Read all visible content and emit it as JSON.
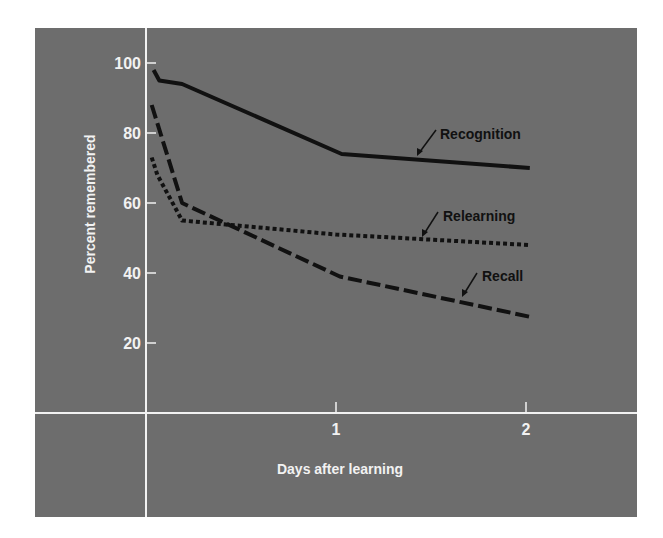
{
  "chart_data": {
    "type": "line",
    "title": "",
    "xlabel": "Days after learning",
    "ylabel": "Percent remembered",
    "xlim": [
      0,
      2.3
    ],
    "ylim": [
      0,
      100
    ],
    "x_ticks": [
      1,
      2
    ],
    "x_tick_labels": [
      "1",
      "2"
    ],
    "y_ticks": [
      20,
      40,
      60,
      80,
      100
    ],
    "y_tick_labels": [
      "20",
      "40",
      "60",
      "80",
      "100"
    ],
    "grid": false,
    "legend": "inline labels with arrows",
    "series": [
      {
        "name": "Recognition",
        "style": "solid",
        "x": [
          0.04,
          0.07,
          0.19,
          1.03,
          2.02
        ],
        "values": [
          98,
          95,
          94,
          74,
          70
        ]
      },
      {
        "name": "Relearning",
        "style": "dotted",
        "x": [
          0.03,
          0.06,
          0.19,
          1.0,
          2.02
        ],
        "values": [
          73,
          68,
          55,
          51,
          48
        ]
      },
      {
        "name": "Recall",
        "style": "dashed",
        "x": [
          0.03,
          0.19,
          1.02,
          2.02
        ],
        "values": [
          88,
          60,
          39,
          27.5
        ]
      }
    ]
  },
  "colors": {
    "background": "#6d6d6d",
    "axis": "#f2f2f2",
    "lines": "#111111"
  }
}
